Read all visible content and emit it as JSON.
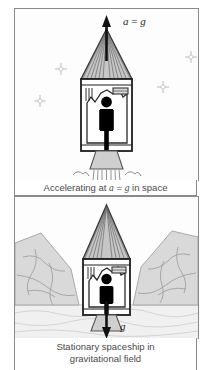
{
  "figure": {
    "background_color": "#ffffff",
    "border_color": "#8b8b8b"
  },
  "panels": [
    {
      "id": "top",
      "scene": "space",
      "caption_lines": [
        "Accelerating at a = g in space"
      ],
      "caption_parts": {
        "before": "Accelerating at ",
        "var1": "a",
        "equals": " = ",
        "var2": "g",
        "after": " in space"
      },
      "arrow": {
        "direction": "up",
        "label_parts": {
          "var1": "a",
          "equals": " = ",
          "var2": "g"
        },
        "label_text": "a = g",
        "color": "#1a1a1a"
      },
      "stars": [
        {
          "x": 46,
          "y": 60,
          "glyph": "star-sparkle"
        },
        {
          "x": 25,
          "y": 92,
          "glyph": "star-sparkle"
        },
        {
          "x": 148,
          "y": 78,
          "glyph": "star-sparkle"
        },
        {
          "x": 176,
          "y": 48,
          "glyph": "star-sparkle"
        }
      ],
      "exhaust": {
        "visible": true,
        "clouds": 2,
        "streak_count": 11
      }
    },
    {
      "id": "bottom",
      "scene": "planet-surface",
      "caption_lines": [
        "Stationary spaceship in",
        "gravitational field"
      ],
      "arrow": {
        "direction": "down",
        "label_text": "g",
        "label_parts": {
          "var1": "g"
        },
        "color": "#1a1a1a"
      },
      "terrain": {
        "ground_color": "#f1f1f1",
        "mountain_color": "#d8d8d8",
        "mountain_outline": "#a0a0a0",
        "mountains": [
          "left",
          "right"
        ]
      },
      "exhaust": {
        "visible": false,
        "clouds": 0,
        "streak_count": 0
      }
    }
  ],
  "rocket": {
    "cone_fill": "#c9c9c9",
    "cone_stripes": "#555555",
    "body_fill": "#ffffff",
    "body_outline": "#222222",
    "nozzle_fill": "#cccccc",
    "figure_color": "#000000",
    "cabin_elements": {
      "instrument_panel": "panel-box",
      "vertical_lines": 3,
      "jagged_wall": "irregular-polygon",
      "occupant": "standing-person-silhouette"
    }
  },
  "colors": {
    "ink": "#1a1a1a",
    "caption_text": "#4a4a4a",
    "gray_light": "#e6e6e6",
    "gray_mid": "#bcbcbc",
    "gray_dark": "#777777",
    "star": "#b9b9b9"
  }
}
